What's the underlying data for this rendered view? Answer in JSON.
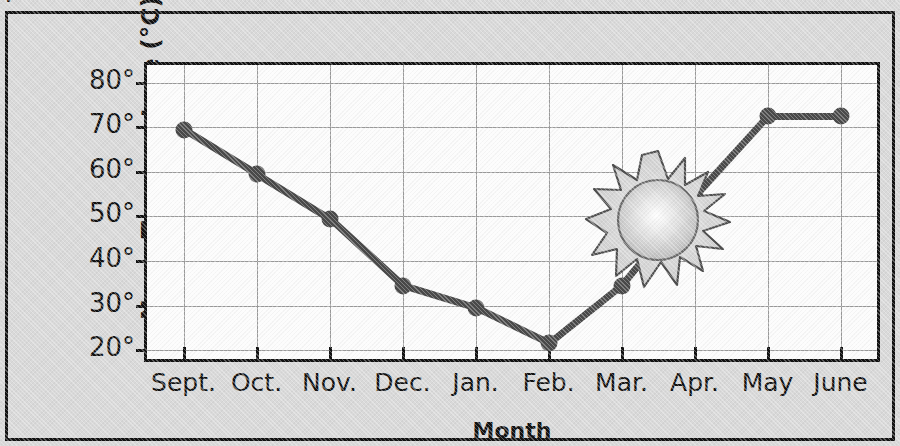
{
  "figure": {
    "cut_off_text_above": "p",
    "background_color": "#d9d9d9",
    "border_color": "#111111",
    "series_color": "#4a4a4a",
    "plot_background": "#fcfcfc",
    "gridline_color": "#9a9a9a"
  },
  "chart_data": {
    "type": "line",
    "title": "",
    "xlabel": "Month",
    "ylabel": "Noon Temperature (°C)",
    "categories": [
      "Sept.",
      "Oct.",
      "Nov.",
      "Dec.",
      "Jan.",
      "Feb.",
      "Mar.",
      "Apr.",
      "May",
      "June"
    ],
    "values": [
      69.5,
      59.5,
      49.5,
      34.5,
      29.5,
      21.5,
      34.5,
      54.5,
      72.5,
      72.5
    ],
    "series": [
      {
        "name": "Noon Temperature",
        "values": [
          69.5,
          59.5,
          49.5,
          34.5,
          29.5,
          21.5,
          34.5,
          54.5,
          72.5,
          72.5
        ]
      }
    ],
    "ylim": [
      18,
      84
    ],
    "yticks": [
      20,
      30,
      40,
      50,
      60,
      70,
      80
    ],
    "ytick_labels": [
      "20°",
      "30°",
      "40°",
      "50°",
      "60°",
      "70°",
      "80°"
    ],
    "grid": true,
    "legend": "none",
    "markers": "filled-circle",
    "annotations": [
      {
        "name": "sun-graphic",
        "label": "sun",
        "x_category": "Feb.",
        "approx_value": 57
      }
    ]
  }
}
